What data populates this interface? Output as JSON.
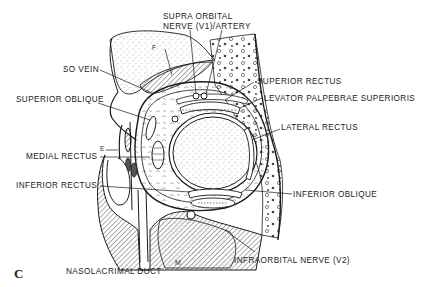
{
  "figure": {
    "panel_letter": "C",
    "labels": {
      "supraorbital_line1": "SUPRA ORBITAL",
      "supraorbital_line2": "NERVE (V1)/ARTERY",
      "so_vein": "SO VEIN",
      "superior_rectus": "SUPERIOR RECTUS",
      "superior_oblique": "SUPERIOR OBLIQUE",
      "levator": "LEVATOR PALPEBRAE SUPERIORIS",
      "lateral_rectus": "LATERAL RECTUS",
      "medial_rectus": "MEDIAL RECTUS",
      "inferior_rectus": "INFERIOR RECTUS",
      "inferior_oblique": "INFERIOR OBLIQUE",
      "infraorbital_nerve": "INFRAORBITAL NERVE (V2)",
      "nasolacrimal_duct": "NASOLACRIMAL DUCT"
    },
    "region_letters": {
      "frontal": "F",
      "ethmoid": "E",
      "maxillary": "M"
    },
    "colors": {
      "ink": "#1a1a1a",
      "background": "#ffffff"
    }
  }
}
